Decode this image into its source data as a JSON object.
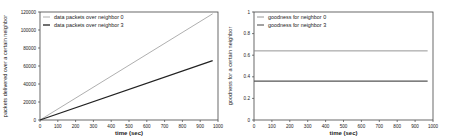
{
  "chart_data": [
    {
      "type": "line",
      "title": "",
      "xlabel": "time (sec)",
      "ylabel": "packets delivered over a certain neighbor",
      "xlim": [
        0,
        1000
      ],
      "ylim": [
        0,
        120000
      ],
      "xticks": [
        0,
        100,
        200,
        300,
        400,
        500,
        600,
        700,
        800,
        900,
        1000
      ],
      "yticks": [
        0,
        20000,
        40000,
        60000,
        80000,
        100000,
        120000
      ],
      "grid": false,
      "legend_position": "upper left",
      "series": [
        {
          "name": "data packets over neighbor 0",
          "x": [
            0,
            970
          ],
          "values": [
            0,
            118000
          ],
          "color": "#9a9a9a",
          "width": 0.8
        },
        {
          "name": "data packets over neighbor 3",
          "x": [
            0,
            970
          ],
          "values": [
            0,
            66000
          ],
          "color": "#222222",
          "width": 1.3
        }
      ]
    },
    {
      "type": "line",
      "title": "",
      "xlabel": "time (sec)",
      "ylabel": "goodness for a certain neighbor",
      "xlim": [
        0,
        1000
      ],
      "ylim": [
        0,
        1
      ],
      "xticks": [
        0,
        100,
        200,
        300,
        400,
        500,
        600,
        700,
        800,
        900,
        1000
      ],
      "yticks": [
        0,
        0.2,
        0.4,
        0.6,
        0.8,
        1
      ],
      "ytick_labels": [
        "0",
        "0.2",
        "0.4",
        "0.6",
        "0.8",
        "1"
      ],
      "grid": false,
      "legend_position": "upper left",
      "series": [
        {
          "name": "goodness for neighbor 0",
          "x": [
            0,
            970
          ],
          "values": [
            0.64,
            0.64
          ],
          "color": "#8a8a8a",
          "width": 0.9
        },
        {
          "name": "goodness for neighbor 3",
          "x": [
            0,
            970
          ],
          "values": [
            0.36,
            0.36
          ],
          "color": "#555555",
          "width": 1.1
        }
      ]
    }
  ],
  "layout": {
    "panels": [
      {
        "left": 40,
        "right": 218,
        "top": 12,
        "bottom": 120
      },
      {
        "left": 254,
        "right": 433,
        "top": 12,
        "bottom": 120
      }
    ]
  }
}
